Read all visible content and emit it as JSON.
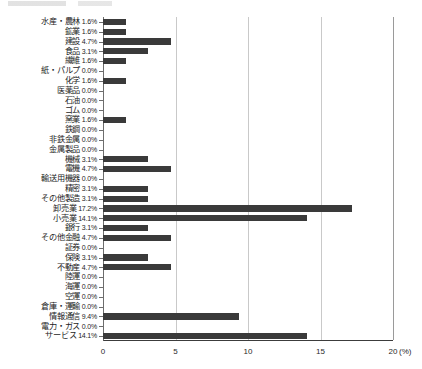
{
  "chart_data": {
    "type": "bar",
    "orientation": "horizontal",
    "title": "",
    "xlabel": "(%)",
    "ylabel": "",
    "xlim": [
      0,
      20
    ],
    "xticks": [
      0,
      5,
      10,
      15,
      20
    ],
    "xtick_labels": [
      "0",
      "5",
      "10",
      "15",
      "20"
    ],
    "unit_label": "(%)",
    "grid": true,
    "grid_axis": "x",
    "legend": "none",
    "bar_color": "#3a3a3a",
    "gridline_color": "#c9c9c9",
    "axis_color": "#6d6d6d",
    "categories": [
      "水産・農林",
      "鉱業",
      "建設",
      "食品",
      "繊維",
      "紙・パルプ",
      "化学",
      "医薬品",
      "石油",
      "ゴム",
      "窯業",
      "鉄鋼",
      "非鉄金属",
      "金属製品",
      "機械",
      "電機",
      "輸送用機器",
      "精密",
      "その他製造",
      "卸売業",
      "小売業",
      "銀行",
      "その他金融",
      "証券",
      "保険",
      "不動産",
      "陸運",
      "海運",
      "空運",
      "倉庫・運輸",
      "情報通信",
      "電力・ガス",
      "サービス"
    ],
    "values": [
      1.6,
      1.6,
      4.7,
      3.1,
      1.6,
      0.0,
      1.6,
      0.0,
      0.0,
      0.0,
      1.6,
      0.0,
      0.0,
      0.0,
      3.1,
      4.7,
      0.0,
      3.1,
      3.1,
      17.2,
      14.1,
      3.1,
      4.7,
      0.0,
      3.1,
      4.7,
      0.0,
      0.0,
      0.0,
      0.0,
      9.4,
      0.0,
      14.1
    ],
    "value_labels": [
      "1.6%",
      "1.6%",
      "4.7%",
      "3.1%",
      "1.6%",
      "0.0%",
      "1.6%",
      "0.0%",
      "0.0%",
      "0.0%",
      "1.6%",
      "0.0%",
      "0.0%",
      "0.0%",
      "3.1%",
      "4.7%",
      "0.0%",
      "3.1%",
      "3.1%",
      "17.2%",
      "14.1%",
      "3.1%",
      "4.7%",
      "0.0%",
      "3.1%",
      "4.7%",
      "0.0%",
      "0.0%",
      "0.0%",
      "0.0%",
      "9.4%",
      "0.0%",
      "14.1%"
    ]
  }
}
